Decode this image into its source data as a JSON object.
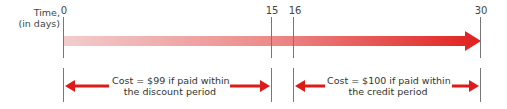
{
  "axis": {
    "label_line1": "Time,",
    "label_line2": "(in days)"
  },
  "ticks": [
    {
      "label": "0",
      "x": 63
    },
    {
      "label": "15",
      "x": 271
    },
    {
      "label": "16",
      "x": 293
    },
    {
      "label": "30",
      "x": 480
    }
  ],
  "periods": [
    {
      "name": "discount",
      "line1": "Cost = $99 if paid within",
      "line2": "the discount period",
      "from": "0",
      "to": "15"
    },
    {
      "name": "credit",
      "line1": "Cost = $100 if paid within",
      "line2": "the credit period",
      "from": "16",
      "to": "30"
    }
  ],
  "colors": {
    "arrow_start": "#f2c6c6",
    "arrow_end": "#e0201e",
    "period_arrow": "#dd1c1a",
    "tick_line": "#777777"
  }
}
